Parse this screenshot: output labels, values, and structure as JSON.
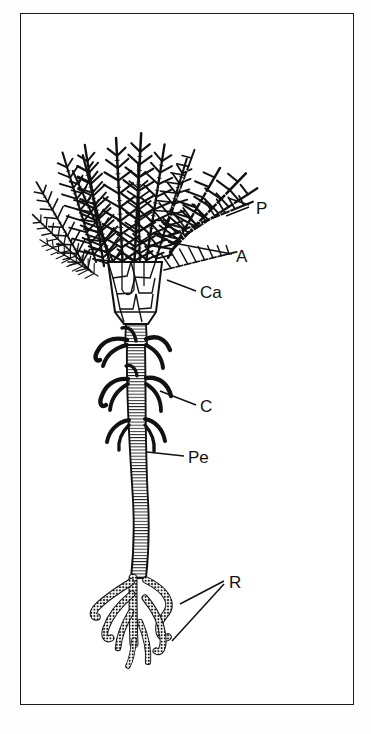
{
  "figure": {
    "style": "black-and-white line drawing",
    "background_color": "#ffffff",
    "ink_color": "#111111",
    "frame": {
      "present": true,
      "color": "#1a1a1a",
      "x": 20,
      "y": 13,
      "width": 334,
      "height": 692
    },
    "labels": [
      {
        "key": "P",
        "text": "P",
        "meaning": "pinnule",
        "x": 262,
        "y": 214,
        "leader": {
          "x1": 249,
          "y1": 209,
          "x2": 228,
          "y2": 203
        },
        "leader2": {
          "x1": 249,
          "y1": 211,
          "x2": 226,
          "y2": 218
        }
      },
      {
        "key": "A",
        "text": "A",
        "meaning": "arm",
        "x": 236,
        "y": 262,
        "leader": {
          "x1": 232,
          "y1": 256,
          "x2": 168,
          "y2": 243
        }
      },
      {
        "key": "Ca",
        "text": "Ca",
        "meaning": "calyx",
        "x": 200,
        "y": 298,
        "leader": {
          "x1": 196,
          "y1": 292,
          "x2": 167,
          "y2": 281
        }
      },
      {
        "key": "C",
        "text": "C",
        "meaning": "cirri",
        "x": 200,
        "y": 412,
        "leader": {
          "x1": 196,
          "y1": 406,
          "x2": 160,
          "y2": 392
        }
      },
      {
        "key": "Pe",
        "text": "Pe",
        "meaning": "peduncle / stalk",
        "x": 188,
        "y": 463,
        "leader": {
          "x1": 184,
          "y1": 457,
          "x2": 148,
          "y2": 452
        }
      },
      {
        "key": "R",
        "text": "R",
        "meaning": "radicular cirri / rootlets",
        "x": 229,
        "y": 585,
        "leader": {
          "x1": 225,
          "y1": 583,
          "x2": 182,
          "y2": 604
        },
        "leader2": {
          "x1": 225,
          "y1": 585,
          "x2": 174,
          "y2": 640
        }
      }
    ],
    "parts": {
      "crown": {
        "description": "dense feathery crown of branched arms bearing pinnules",
        "top": 85,
        "bottom": 270
      },
      "calyx": {
        "description": "cup of polygonal plates",
        "top": 255,
        "bottom": 330
      },
      "stalk": {
        "description": "long segmented column of stacked columnals",
        "top": 330,
        "bottom": 580
      },
      "cirri_whorls": {
        "count": 3,
        "description": "whorls of dark curved cirri on upper stalk"
      },
      "rootlets": {
        "description": "branching segmented radicular cirri forming holdfast",
        "top": 575,
        "bottom": 665
      }
    }
  }
}
